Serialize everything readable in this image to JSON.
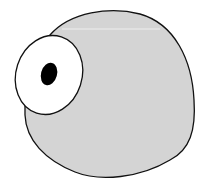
{
  "figure": {
    "title": "Cartoon blob creature with one eye",
    "colors": {
      "background": "#ffffff",
      "body_fill": "#d4d4d4",
      "outline": "#111111",
      "eye_white": "#ffffff",
      "pupil": "#000000"
    },
    "shapes": [
      {
        "name": "body",
        "type": "blob"
      },
      {
        "name": "eye",
        "type": "ellipse"
      },
      {
        "name": "pupil",
        "type": "ellipse"
      }
    ]
  }
}
